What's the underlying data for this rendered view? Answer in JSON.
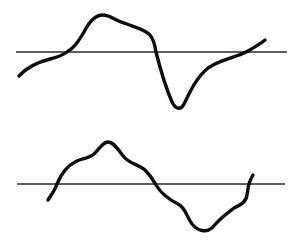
{
  "diagram": {
    "colors": {
      "background": "#ffffff",
      "trace": "#0d0d0d",
      "baseline": "#2a2a2a"
    },
    "panels": [
      {
        "name": "top-waveform",
        "baseline": {
          "x1": 16,
          "x2": 287,
          "y": 52
        },
        "shape": "positive broad peak followed by sharp negative trough",
        "path": "M19,76 C28,66 38,62 50,59 C58,57 63,55 67,52 C74,48 78,42 84,32 C90,20 96,15 103,15 C110,15 114,20 124,23 C134,27 145,29 150,35 C154,40 155,45 156,52 C160,68 166,88 172,102 C176,110 181,110 184,104 C190,92 196,78 208,68 C218,61 226,60 236,56 C242,54 245,53 248,51 C255,47 260,44 265,40"
      },
      {
        "name": "bottom-waveform",
        "baseline": {
          "x1": 17,
          "x2": 285,
          "y": 184
        },
        "shape": "positive double-humped peak followed by rounded negative trough",
        "path": "M48,200 C52,194 55,190 57,184 C62,172 67,166 75,162 C82,158 88,159 94,154 C100,148 103,142 108,142 C114,142 118,150 124,157 C130,164 138,164 145,170 C150,175 153,179 156,185 C162,195 170,200 178,204 C186,208 186,216 192,224 C198,231 206,233 212,228 C220,218 226,214 234,208 C242,204 246,202 247,195 C248,190 248,186 249,184 C250,180 252,177 253,175"
      }
    ]
  }
}
